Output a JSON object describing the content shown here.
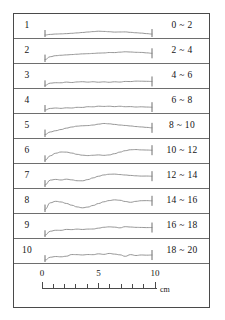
{
  "figure": {
    "title_visible": false,
    "stroke_color": "#6e6e6e",
    "profile_color": "#8a8a8a",
    "text_color": "#141414",
    "rows": [
      {
        "index": "1",
        "range": "0 ~ 2",
        "profile_id": "profile-1"
      },
      {
        "index": "2",
        "range": "2 ~ 4",
        "profile_id": "profile-2"
      },
      {
        "index": "3",
        "range": "4 ~ 6",
        "profile_id": "profile-3"
      },
      {
        "index": "4",
        "range": "6 ~ 8",
        "profile_id": "profile-4"
      },
      {
        "index": "5",
        "range": "8 ~ 10",
        "profile_id": "profile-5"
      },
      {
        "index": "6",
        "range": "10 ~ 12",
        "profile_id": "profile-6"
      },
      {
        "index": "7",
        "range": "12 ~ 14",
        "profile_id": "profile-7"
      },
      {
        "index": "8",
        "range": "14 ~ 16",
        "profile_id": "profile-8"
      },
      {
        "index": "9",
        "range": "16 ~ 18",
        "profile_id": "profile-9"
      },
      {
        "index": "10",
        "range": "18 ~ 20",
        "profile_id": "profile-10"
      }
    ],
    "scale": {
      "unit": "cm",
      "min": 0,
      "max": 10,
      "major_ticks": [
        "0",
        "5",
        "10"
      ],
      "major_tick_values": [
        0,
        5,
        10
      ],
      "minor_tick_interval": 1,
      "tick_count": 11
    }
  },
  "chart_data": {
    "type": "line",
    "title": "",
    "xlabel": "cm",
    "ylabel": "",
    "xlim": [
      0,
      10
    ],
    "grid": false,
    "legend": "none",
    "x": [
      0,
      0.5,
      1,
      1.5,
      2,
      2.5,
      3,
      3.5,
      4,
      4.5,
      5,
      5.5,
      6,
      6.5,
      7,
      7.5,
      8,
      8.5,
      9,
      9.5,
      10
    ],
    "series": [
      {
        "name": "1",
        "label": "0 ~ 2",
        "values": [
          0.0,
          0.06,
          0.1,
          0.12,
          0.14,
          0.16,
          0.18,
          0.2,
          0.22,
          0.24,
          0.26,
          0.24,
          0.22,
          0.2,
          0.22,
          0.24,
          0.22,
          0.2,
          0.18,
          0.14,
          0.1
        ]
      },
      {
        "name": "2",
        "label": "2 ~ 4",
        "values": [
          0.0,
          0.22,
          0.3,
          0.34,
          0.38,
          0.42,
          0.46,
          0.5,
          0.52,
          0.54,
          0.56,
          0.56,
          0.58,
          0.56,
          0.58,
          0.6,
          0.58,
          0.56,
          0.56,
          0.54,
          0.52
        ]
      },
      {
        "name": "3",
        "label": "4 ~ 6",
        "values": [
          0.0,
          0.16,
          0.18,
          0.16,
          0.2,
          0.16,
          0.2,
          0.22,
          0.2,
          0.24,
          0.22,
          0.26,
          0.24,
          0.28,
          0.26,
          0.3,
          0.28,
          0.3,
          0.28,
          0.26,
          0.24
        ]
      },
      {
        "name": "4",
        "label": "6 ~ 8",
        "values": [
          0.0,
          0.14,
          0.18,
          0.16,
          0.2,
          0.18,
          0.22,
          0.2,
          0.24,
          0.22,
          0.26,
          0.24,
          0.26,
          0.24,
          0.28,
          0.26,
          0.28,
          0.26,
          0.28,
          0.26,
          0.24
        ]
      },
      {
        "name": "5",
        "label": "8 ~ 10",
        "values": [
          0.0,
          0.2,
          0.3,
          0.4,
          0.52,
          0.62,
          0.7,
          0.74,
          0.76,
          0.8,
          0.86,
          0.9,
          0.86,
          0.8,
          0.74,
          0.7,
          0.66,
          0.62,
          0.6,
          0.58,
          0.56
        ]
      },
      {
        "name": "6",
        "label": "10 ~ 12",
        "values": [
          0.0,
          0.34,
          0.52,
          0.6,
          0.58,
          0.5,
          0.4,
          0.34,
          0.32,
          0.36,
          0.4,
          0.38,
          0.42,
          0.52,
          0.64,
          0.74,
          0.8,
          0.8,
          0.76,
          0.74,
          0.72
        ]
      },
      {
        "name": "7",
        "label": "12 ~ 14",
        "values": [
          0.0,
          0.4,
          0.46,
          0.42,
          0.48,
          0.42,
          0.34,
          0.32,
          0.4,
          0.52,
          0.64,
          0.74,
          0.8,
          0.82,
          0.8,
          0.78,
          0.76,
          0.74,
          0.72,
          0.72,
          0.7
        ]
      },
      {
        "name": "8",
        "label": "14 ~ 16",
        "values": [
          0.0,
          0.52,
          0.64,
          0.6,
          0.5,
          0.38,
          0.26,
          0.2,
          0.26,
          0.38,
          0.52,
          0.64,
          0.72,
          0.76,
          0.72,
          0.62,
          0.56,
          0.64,
          0.7,
          0.72,
          0.72
        ]
      },
      {
        "name": "9",
        "label": "16 ~ 18",
        "values": [
          0.0,
          0.3,
          0.36,
          0.34,
          0.4,
          0.38,
          0.42,
          0.4,
          0.44,
          0.46,
          0.54,
          0.62,
          0.66,
          0.64,
          0.58,
          0.66,
          0.62,
          0.58,
          0.56,
          0.54,
          0.54
        ]
      },
      {
        "name": "10",
        "label": "18 ~ 20",
        "values": [
          0.0,
          0.24,
          0.3,
          0.28,
          0.32,
          0.44,
          0.42,
          0.38,
          0.4,
          0.38,
          0.44,
          0.4,
          0.48,
          0.44,
          0.4,
          0.3,
          0.44,
          0.38,
          0.42,
          0.4,
          0.4
        ]
      }
    ]
  }
}
